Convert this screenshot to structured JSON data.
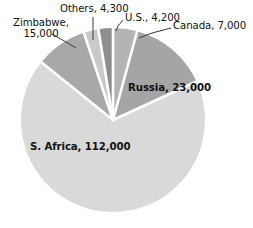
{
  "chart_data": {
    "type": "pie",
    "title": "",
    "subtitle": "",
    "xlabel": "",
    "ylabel": "",
    "legend_position": "none",
    "grid": false,
    "total": 165500,
    "units": "",
    "categories": [
      "Canada",
      "Russia",
      "S. Africa",
      "Zimbabwe",
      "Others",
      "U.S."
    ],
    "values": [
      7000,
      23000,
      112000,
      15000,
      4300,
      4200
    ],
    "labels": [
      "Canada, 7,000",
      "Russia, 23,000",
      "S. Africa, 112,000",
      "Zimbabwe, 15,000",
      "Others, 4,300",
      "U.S., 4,200"
    ],
    "slice_colors": [
      "#b4b4b4",
      "#a5a5a5",
      "#d9d9d9",
      "#a8a8a8",
      "#c9c9c9",
      "#8e8e8e"
    ],
    "slice_separator_color": "#ffffff",
    "start_angle_deg": 0,
    "direction": "clockwise",
    "slices": [
      {
        "name": "Canada",
        "value": 7000,
        "label": "Canada, 7,000",
        "percent": 4.2,
        "color": "#b4b4b4",
        "label_placement": "outside-leader"
      },
      {
        "name": "Russia",
        "value": 23000,
        "label": "Russia, 23,000",
        "percent": 13.9,
        "color": "#a5a5a5",
        "label_placement": "inside"
      },
      {
        "name": "S. Africa",
        "value": 112000,
        "label": "S. Africa, 112,000",
        "percent": 67.7,
        "color": "#d9d9d9",
        "label_placement": "inside"
      },
      {
        "name": "Zimbabwe",
        "value": 15000,
        "label": "Zimbabwe, 15,000",
        "percent": 9.1,
        "color": "#a8a8a8",
        "label_placement": "outside-leader"
      },
      {
        "name": "Others",
        "value": 4300,
        "label": "Others, 4,300",
        "percent": 2.6,
        "color": "#c9c9c9",
        "label_placement": "outside-leader"
      },
      {
        "name": "U.S.",
        "value": 4200,
        "label": "U.S., 4,200",
        "percent": 2.5,
        "color": "#8e8e8e",
        "label_placement": "outside-leader"
      }
    ]
  },
  "labels": {
    "zimbabwe_line1": "Zimbabwe,",
    "zimbabwe_line2": "15,000",
    "others": "Others, 4,300",
    "us": "U.S., 4,200",
    "canada": "Canada, 7,000",
    "russia": "Russia, 23,000",
    "safrica": "S. Africa, 112,000"
  },
  "colors": {
    "background": "#ffffff",
    "text": "#121212",
    "leader_line": "#3a3a3a",
    "separator": "#ffffff"
  }
}
